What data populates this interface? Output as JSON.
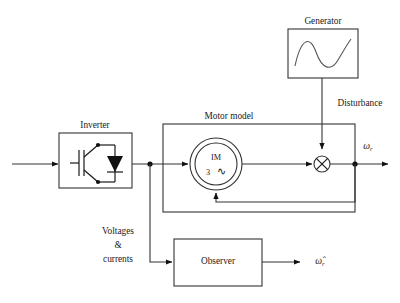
{
  "figure": {
    "kind": "control-block-diagram",
    "title_visible": false,
    "background": "#ffffff",
    "line_color": "#333333",
    "text_color": "#1a1a1a"
  },
  "blocks": {
    "inverter": {
      "label": "Inverter",
      "symbol": "igbt-with-antiparallel-diode",
      "x": 59,
      "y": 133,
      "w": 73,
      "h": 55
    },
    "motor_model": {
      "label": "Motor model",
      "x": 163,
      "y": 124,
      "w": 192,
      "h": 88
    },
    "machine": {
      "label_top": "IM",
      "label_bottom_number": "3",
      "label_bottom_symbol": "∿",
      "symbol": "induction-machine-double-circle",
      "cx": 216,
      "cy": 164,
      "r_outer": 26,
      "r_inner": 21
    },
    "generator": {
      "label": "Generator",
      "symbol": "sine-wave",
      "x": 288,
      "y": 29,
      "w": 70,
      "h": 49
    },
    "observer": {
      "label": "Observer",
      "x": 174,
      "y": 239,
      "w": 88,
      "h": 47
    },
    "summing_junction": {
      "symbol": "cross-multiplier",
      "cx": 322,
      "cy": 164,
      "r": 8
    }
  },
  "signals": {
    "disturbance_label": "Disturbance",
    "voltages_currents": {
      "line1": "Voltages",
      "line2": "&",
      "line3": "currents"
    },
    "speed_output": {
      "greek": "ω",
      "subscript": "r"
    },
    "speed_estimate": {
      "greek": "ω̂",
      "subscript": "r"
    }
  },
  "nodes": [
    {
      "name": "tap-after-inverter",
      "x": 150,
      "y": 164
    },
    {
      "name": "tap-after-summer",
      "x": 355,
      "y": 164
    }
  ],
  "arrows": [
    "input-to-inverter",
    "inverter-to-machine",
    "machine-to-summer",
    "generator-to-summer",
    "summer-to-output",
    "feedback-to-machine",
    "tap-to-observer",
    "observer-to-estimate"
  ]
}
